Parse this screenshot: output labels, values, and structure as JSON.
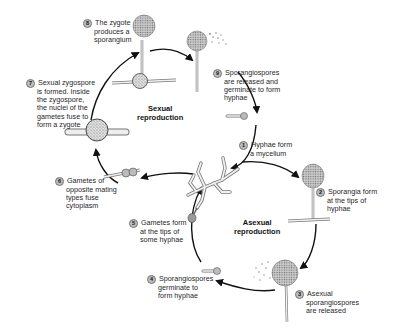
{
  "diagram": {
    "cycles": {
      "sexual": {
        "label_line1": "Sexual",
        "label_line2": "reproduction"
      },
      "asexual": {
        "label_line1": "Asexual",
        "label_line2": "reproduction"
      }
    },
    "steps": [
      {
        "num": "1",
        "lines": [
          "Hyphae form",
          "a mycelium"
        ]
      },
      {
        "num": "2",
        "lines": [
          "Sporangia form",
          "at the tips of",
          "hyphae"
        ]
      },
      {
        "num": "3",
        "lines": [
          "Asexual",
          "sporangiospores",
          "are released"
        ]
      },
      {
        "num": "4",
        "lines": [
          "Sporangiospores",
          "germinate to",
          "form hyphae"
        ]
      },
      {
        "num": "5",
        "lines": [
          "Gametes form",
          "at the tips of",
          "some hyphae"
        ]
      },
      {
        "num": "6",
        "lines": [
          "Gametes of",
          "opposite mating",
          "types fuse",
          "cytoplasm"
        ]
      },
      {
        "num": "7",
        "lines": [
          "Sexual zygospore",
          "is formed.  Inside",
          "the zygospore,",
          "the nuclei of the",
          "gametes fuse to",
          "form a zygote"
        ]
      },
      {
        "num": "8",
        "lines": [
          "The zygote",
          "produces a",
          "sporangium"
        ]
      },
      {
        "num": "9",
        "lines": [
          "Sporangiospores",
          "are released and",
          "germinate to form",
          "hyphae"
        ]
      }
    ],
    "colors": {
      "arrow": "#111111",
      "sporangium": "#9a9a9a",
      "hyphae_fill": "#f2f2f2",
      "hyphae_stroke": "#777777"
    }
  }
}
